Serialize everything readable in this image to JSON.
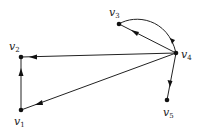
{
  "diagram": {
    "type": "directed-graph",
    "nodes": [
      {
        "id": "v1",
        "label": "v",
        "sub": "1",
        "x": 21,
        "y": 110,
        "lx": 14,
        "ly": 116
      },
      {
        "id": "v2",
        "label": "v",
        "sub": "2",
        "x": 21,
        "y": 57,
        "lx": 9,
        "ly": 41
      },
      {
        "id": "v3",
        "label": "v",
        "sub": "3",
        "x": 119,
        "y": 24,
        "lx": 109,
        "ly": 7
      },
      {
        "id": "v4",
        "label": "v",
        "sub": "4",
        "x": 176,
        "y": 53,
        "lx": 181,
        "ly": 49
      },
      {
        "id": "v5",
        "label": "v",
        "sub": "5",
        "x": 167,
        "y": 100,
        "lx": 163,
        "ly": 107
      }
    ],
    "edges": [
      {
        "from": "v4",
        "to": "v3",
        "shape": "straight"
      },
      {
        "from": "v3",
        "to": "v4",
        "shape": "arc"
      },
      {
        "from": "v4",
        "to": "v2",
        "shape": "straight"
      },
      {
        "from": "v4",
        "to": "v1",
        "shape": "straight"
      },
      {
        "from": "v1",
        "to": "v2",
        "shape": "straight"
      },
      {
        "from": "v4",
        "to": "v5",
        "shape": "straight"
      }
    ]
  }
}
